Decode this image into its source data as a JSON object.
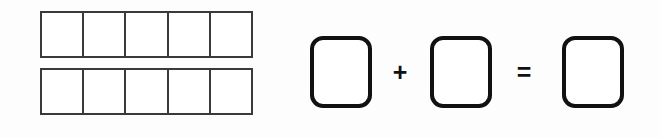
{
  "document": {
    "title": "Ten Frame Addition",
    "background_color": "#fdfdfd"
  },
  "ten_frame": {
    "name": "ten-frame",
    "rows": 2,
    "columns": 5,
    "total_cells": 10,
    "filled_count": 0,
    "border_color": "#3a3a3a",
    "cell_fill_color": "#ffffff",
    "cells": [
      {
        "row": 1,
        "col": 1,
        "filled": false,
        "label": ""
      },
      {
        "row": 1,
        "col": 2,
        "filled": false,
        "label": ""
      },
      {
        "row": 1,
        "col": 3,
        "filled": false,
        "label": ""
      },
      {
        "row": 1,
        "col": 4,
        "filled": false,
        "label": ""
      },
      {
        "row": 1,
        "col": 5,
        "filled": false,
        "label": ""
      },
      {
        "row": 2,
        "col": 1,
        "filled": false,
        "label": ""
      },
      {
        "row": 2,
        "col": 2,
        "filled": false,
        "label": ""
      },
      {
        "row": 2,
        "col": 3,
        "filled": false,
        "label": ""
      },
      {
        "row": 2,
        "col": 4,
        "filled": false,
        "label": ""
      },
      {
        "row": 2,
        "col": 5,
        "filled": false,
        "label": ""
      }
    ]
  },
  "equation": {
    "name": "addition-equation",
    "border_color": "#111111",
    "addend_1": {
      "value": "",
      "placeholder": ""
    },
    "operator_plus": "+",
    "addend_2": {
      "value": "",
      "placeholder": ""
    },
    "operator_equals": "=",
    "sum": {
      "value": "",
      "placeholder": ""
    }
  }
}
